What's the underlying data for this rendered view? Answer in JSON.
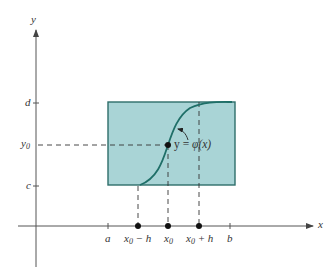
{
  "figure": {
    "colors": {
      "fill": "#a9d4d6",
      "border": "#2e6e6a",
      "curve": "#1f6f68",
      "axis": "#555555",
      "dash": "#333333",
      "point": "#111111"
    },
    "axes": {
      "x_label": "x",
      "y_label": "y"
    },
    "x_ticks": {
      "a": "a",
      "x0_minus_h_base": "x",
      "x0_minus_h_sub": "0",
      "x0_minus_h_tail": " − h",
      "x0_base": "x",
      "x0_sub": "0",
      "x0_plus_h_base": "x",
      "x0_plus_h_sub": "0",
      "x0_plus_h_tail": " + h",
      "b": "b"
    },
    "y_ticks": {
      "d": "d",
      "y0_base": "y",
      "y0_sub": "0",
      "c": "c"
    },
    "curve_label": {
      "y": "y",
      "equals": " = ",
      "phi": "φ",
      "arg": "(x)"
    }
  }
}
